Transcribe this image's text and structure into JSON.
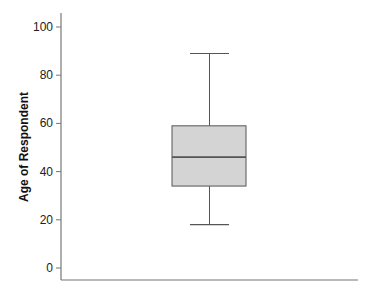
{
  "chart_data": {
    "type": "box",
    "title": "",
    "xlabel": "",
    "ylabel": "Age of Respondent",
    "ylim": [
      -5,
      105
    ],
    "yticks": [
      0,
      20,
      40,
      60,
      80,
      100
    ],
    "ytick_labels": [
      "0",
      "20",
      "40",
      "60",
      "80",
      "100"
    ],
    "grid": false,
    "legend": null,
    "series": [
      {
        "name": "Age of Respondent",
        "min": 18,
        "q1": 34,
        "median": 46,
        "q3": 59,
        "max": 89
      }
    ],
    "colors": {
      "box_fill": "#d4d4d4",
      "box_stroke": "#555555",
      "axis": "#777777"
    }
  }
}
